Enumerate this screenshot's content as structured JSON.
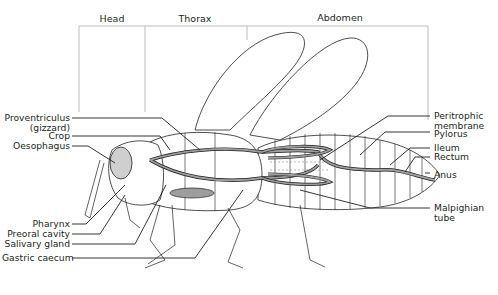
{
  "regions": [
    {
      "id": "head",
      "label": "Head"
    },
    {
      "id": "thorax",
      "label": "Thorax"
    },
    {
      "id": "abdomen",
      "label": "Abdomen"
    }
  ],
  "labels_left": [
    {
      "id": "proventriculus",
      "line1": "Proventriculus",
      "line2": "(gizzard)"
    },
    {
      "id": "crop",
      "line1": "Crop"
    },
    {
      "id": "oesophagus",
      "line1": "Oesophagus"
    },
    {
      "id": "pharynx",
      "line1": "Pharynx"
    },
    {
      "id": "preoral-cavity",
      "line1": "Preoral cavity"
    },
    {
      "id": "salivary-gland",
      "line1": "Salivary gland"
    },
    {
      "id": "gastric-caecum",
      "line1": "Gastric caecum"
    }
  ],
  "labels_right": [
    {
      "id": "peritrophic-membrane",
      "line1": "Peritrophic",
      "line2": "membrane"
    },
    {
      "id": "pylorus",
      "line1": "Pylorus"
    },
    {
      "id": "ileum",
      "line1": "Ileum"
    },
    {
      "id": "rectum",
      "line1": "Rectum"
    },
    {
      "id": "anus",
      "line1": "Anus"
    },
    {
      "id": "malpighian-tube",
      "line1": "Malpighian",
      "line2": "tube"
    }
  ],
  "colors": {
    "line": "#231f20",
    "gut_fill": "#9d9d9d",
    "region_line": "#b5b5b5",
    "background": "#ffffff"
  }
}
